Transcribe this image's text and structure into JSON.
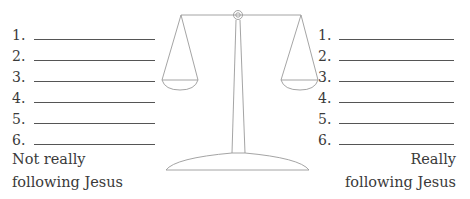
{
  "left_column": {
    "items": [
      {
        "number": "1.",
        "value": ""
      },
      {
        "number": "2.",
        "value": ""
      },
      {
        "number": "3.",
        "value": ""
      },
      {
        "number": "4.",
        "value": ""
      },
      {
        "number": "5.",
        "value": ""
      },
      {
        "number": "6.",
        "value": ""
      }
    ],
    "caption_line1": "Not really",
    "caption_line2": "following Jesus"
  },
  "right_column": {
    "items": [
      {
        "number": "1.",
        "value": ""
      },
      {
        "number": "2.",
        "value": ""
      },
      {
        "number": "3.",
        "value": ""
      },
      {
        "number": "4.",
        "value": ""
      },
      {
        "number": "5.",
        "value": ""
      },
      {
        "number": "6.",
        "value": ""
      }
    ],
    "caption_line1": "Really",
    "caption_line2": "following Jesus"
  },
  "illustration": {
    "icon": "balance-scale-icon",
    "stroke_color": "#9a9a9a"
  }
}
